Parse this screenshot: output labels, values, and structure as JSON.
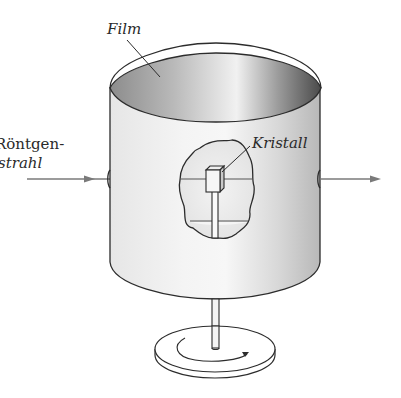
{
  "diagram": {
    "type": "Debye-Scherrer camera / rotating crystal X-ray setup",
    "labels": {
      "film": "Film",
      "xray_line1": "Röntgen-",
      "xray_line2": "strahl",
      "crystal": "Kristall"
    },
    "components": [
      "cylindrical film",
      "X-ray beam (incoming)",
      "X-ray beam (outgoing)",
      "crystal",
      "rotation rod",
      "rotating base disc",
      "rotation direction arrow"
    ],
    "colors": {
      "ink": "#2c2c2c",
      "beam": "#7a7a7a",
      "film_light": "#f2f2f2",
      "film_mid": "#cfcfcf",
      "film_dark": "#6e6e6e"
    }
  }
}
